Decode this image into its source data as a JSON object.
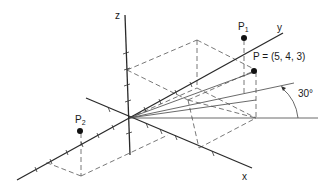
{
  "figure": {
    "axes": {
      "x_label": "x",
      "y_label": "y",
      "z_label": "z"
    },
    "points": [
      {
        "id": "P",
        "label": "P = (5, 4, 3)",
        "coords": [
          5,
          4,
          3
        ]
      },
      {
        "id": "P1",
        "label_main": "P",
        "label_sub": "1"
      },
      {
        "id": "P2",
        "label_main": "P",
        "label_sub": "2"
      }
    ],
    "angle_label": "30°",
    "colors": {
      "line": "#2a2a2a",
      "background": "#ffffff"
    }
  }
}
